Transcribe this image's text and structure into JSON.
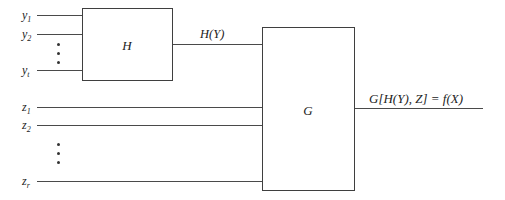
{
  "diagram": {
    "type": "block-diagram",
    "blocks": {
      "h": {
        "label": "H"
      },
      "g": {
        "label": "G"
      }
    },
    "inputs_y": [
      {
        "base": "y",
        "sub": "1"
      },
      {
        "base": "y",
        "sub": "2"
      },
      {
        "base": "y",
        "sub": "t"
      }
    ],
    "inputs_z": [
      {
        "base": "z",
        "sub": "1"
      },
      {
        "base": "z",
        "sub": "2"
      },
      {
        "base": "z",
        "sub": "r"
      }
    ],
    "intermediate": {
      "label": "H(Y)"
    },
    "output": {
      "label": "G[H(Y), Z] = f(X)"
    },
    "ellipsis": "⋮"
  },
  "colors": {
    "line": "#4a4a4a",
    "text": "#222222",
    "background": "#ffffff"
  }
}
